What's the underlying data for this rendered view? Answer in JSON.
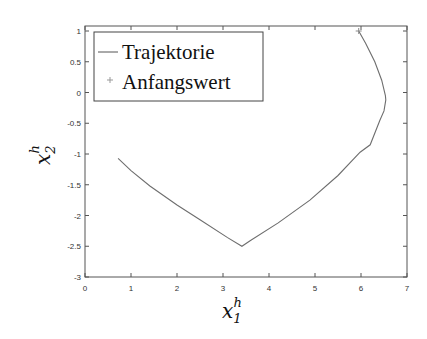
{
  "chart_data": {
    "type": "line",
    "title": "",
    "xlabel": "x_1^h",
    "ylabel": "x_2^h",
    "xlabel_parts": {
      "base": "x",
      "sub": "1",
      "sup": "h"
    },
    "ylabel_parts": {
      "base": "x",
      "sub": "2",
      "sup": "h"
    },
    "xlim": [
      0,
      7
    ],
    "ylim": [
      -3,
      1
    ],
    "xticks": [
      0,
      1,
      2,
      3,
      4,
      5,
      6,
      7
    ],
    "xtick_labels": [
      "0",
      "1",
      "2",
      "3",
      "4",
      "5",
      "6",
      "7"
    ],
    "yticks": [
      1,
      0.5,
      0,
      -0.5,
      -1,
      -1.5,
      -2,
      -2.5,
      -3
    ],
    "ytick_labels": [
      "1",
      "0.5",
      "0",
      "-0.5",
      "-1",
      "-1.5",
      "-2",
      "-2.5",
      "-3"
    ],
    "grid": false,
    "legend_position": "upper left",
    "series": [
      {
        "name": "Trajektorie",
        "style": "line",
        "color": "#6e6e6e",
        "x": [
          5.95,
          6.1,
          6.3,
          6.45,
          6.53,
          6.54,
          6.5,
          6.41,
          6.2,
          5.98,
          5.5,
          4.89,
          4.2,
          3.59,
          3.41,
          3.1,
          2.5,
          2.0,
          1.41,
          1.0,
          0.72
        ],
        "y": [
          1.0,
          0.8,
          0.5,
          0.2,
          -0.05,
          -0.12,
          -0.3,
          -0.45,
          -0.85,
          -0.97,
          -1.35,
          -1.75,
          -2.12,
          -2.41,
          -2.5,
          -2.36,
          -2.07,
          -1.83,
          -1.52,
          -1.27,
          -1.07
        ]
      },
      {
        "name": "Anfangswert",
        "style": "marker-plus",
        "color": "#8a8a8a",
        "x": [
          5.95
        ],
        "y": [
          1.0
        ]
      }
    ]
  },
  "legend": {
    "items": [
      {
        "label": "Trajektorie",
        "symbol": "line"
      },
      {
        "label": "Anfangswert",
        "symbol": "plus"
      }
    ]
  },
  "axes": {
    "xlabel_base": "x",
    "xlabel_sub": "1",
    "xlabel_sup": "h",
    "ylabel_base": "x",
    "ylabel_sub": "2",
    "ylabel_sup": "h"
  }
}
